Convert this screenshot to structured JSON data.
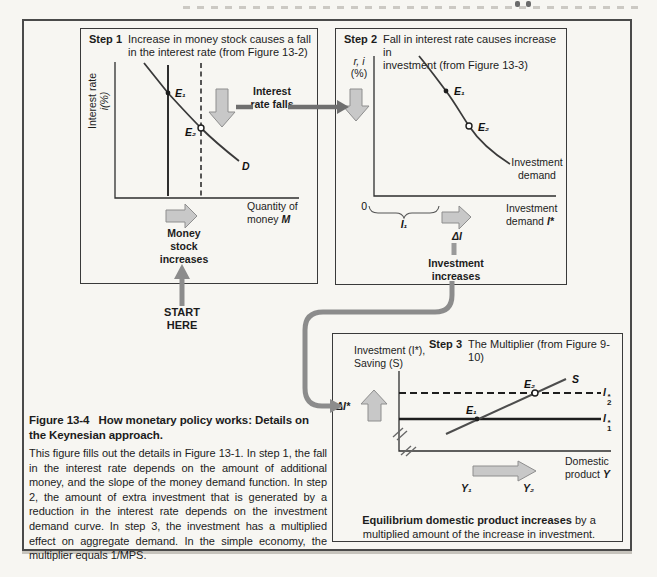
{
  "colors": {
    "page_bg": "#f7f6f2",
    "box_border": "#3a3a3a",
    "block_arrow_fill": "#c8c8c8",
    "block_arrow_stroke": "#8e8e8e",
    "connector_gray": "#8c8c8c",
    "flow_arrow_dark": "#6f6f6f",
    "ink": "#1c1c1c"
  },
  "step1": {
    "step_label": "Step 1",
    "title": "Increase in money stock causes a fall\nin the interest rate (from Figure 13-2)",
    "y_axis_line1": "Interest rate",
    "y_axis_line2": "i(%)",
    "point_e1": "E₁",
    "point_e2": "E₂",
    "demand_curve_label": "D",
    "x_axis_line1": "Quantity of",
    "x_axis_line2": "money",
    "x_axis_var": "M",
    "money_arrow_caption": "Money stock increases",
    "interest_falls_label": "Interest rate falls",
    "start_here_label": "START HERE"
  },
  "step2": {
    "step_label": "Step 2",
    "title": "Fall in interest rate causes increase in\ninvestment (from Figure 13-3)",
    "y_axis_line1": "r, i",
    "y_axis_line2": "(%)",
    "point_e1": "E₁",
    "point_e2": "E₂",
    "curve_label": "Investment demand",
    "origin_label": "0",
    "i1_span_label": "I₁",
    "delta_i_label": "ΔI",
    "x_axis_line1": "Investment",
    "x_axis_line2": "demand",
    "x_axis_var": "I*",
    "investment_arrow_caption": "Investment increases"
  },
  "step3": {
    "step_label": "Step 3",
    "title": "The Multiplier (from Figure 9-10)",
    "y_axis_line1": "Investment (I*),",
    "y_axis_line2": "Saving (S)",
    "s_curve_label": "S",
    "i2_line_label": {
      "base": "I",
      "sup": "*",
      "sub": "2"
    },
    "i1_line_label": {
      "base": "I",
      "sup": "*",
      "sub": "1"
    },
    "point_e1": "E₁",
    "point_e2": "E₂",
    "delta_i_label": "ΔI*",
    "y1_label": "Y₁",
    "y2_label": "Y₂",
    "x_axis_line1": "Domestic",
    "x_axis_line2": "product",
    "x_axis_var": "Y",
    "note_bold": "Equilibrium domestic product increases",
    "note_rest": " by a\nmultiplied amount of the increase in investment."
  },
  "caption": {
    "title": "Figure 13-4   How monetary policy works: Details on\nthe Keynesian approach.",
    "body": "This figure fills out the details in Figure 13-1. In step 1, the fall in the interest rate depends on the amount of additional money, and the slope of the money demand function. In step 2, the amount of extra investment that is generated by a reduction in the interest rate depends on the investment demand curve. In step 3, the investment has a multiplied effect on aggregate demand. In the simple economy, the multiplier equals 1/MPS."
  }
}
